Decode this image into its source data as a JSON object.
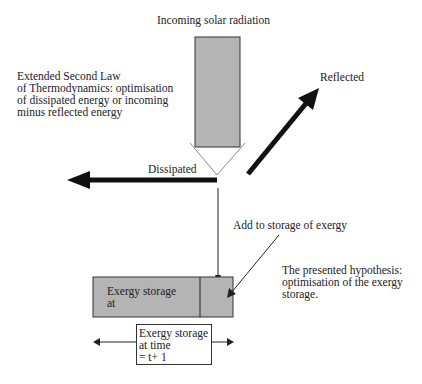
{
  "diagram": {
    "incoming_label": "Incoming solar radiation",
    "reflected_label": "Reflected",
    "dissipated_label": "Dissipated",
    "second_law_text": [
      "Extended Second Law",
      "of Thermodynamics: optimisation",
      "of dissipated energy or incoming",
      "minus reflected energy"
    ],
    "add_storage_label": "Add to storage of exergy",
    "hypothesis_text": [
      "The presented hypothesis:",
      "optimisation of the exergy",
      "storage."
    ],
    "storage_box_text": [
      "Exergy storage",
      "at"
    ],
    "next_box_text": [
      "Exergy storage",
      "at time",
      "= t+ 1"
    ],
    "colors": {
      "fill_gray": "#b4b4b4",
      "arrow_black": "#111111",
      "outline": "#333333",
      "chevron": "#888888"
    }
  }
}
